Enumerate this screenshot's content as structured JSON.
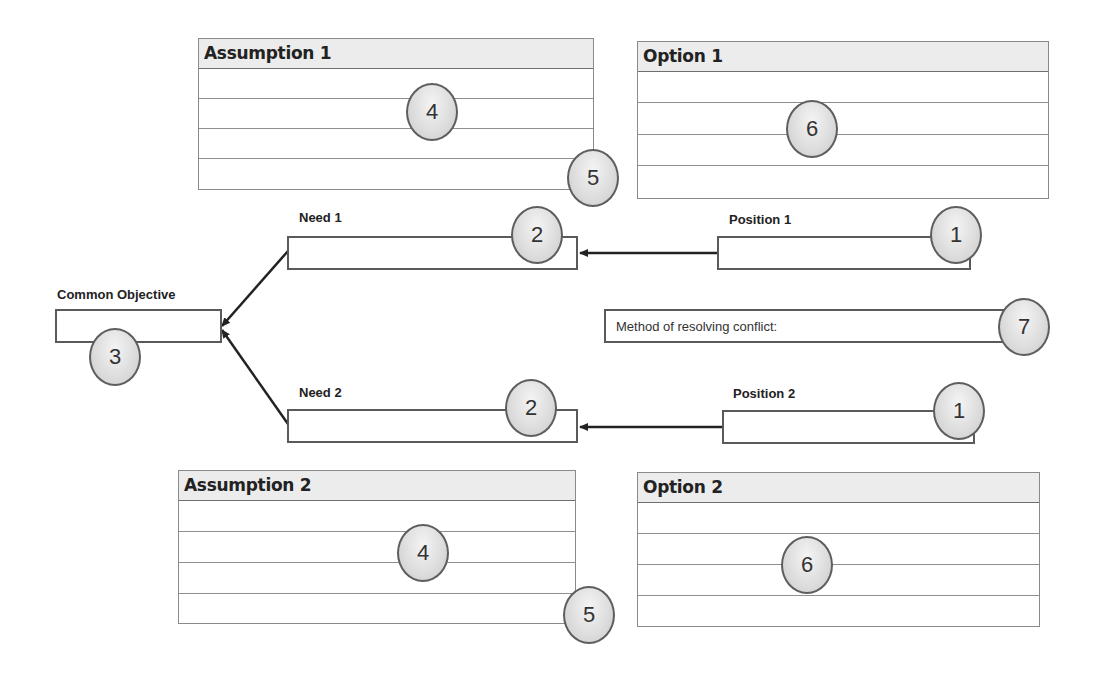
{
  "diagram": {
    "assumption_1": {
      "title": "Assumption 1",
      "rows": 4
    },
    "assumption_2": {
      "title": "Assumption 2",
      "rows": 4
    },
    "option_1": {
      "title": "Option 1",
      "rows": 4
    },
    "option_2": {
      "title": "Option 2",
      "rows": 4
    },
    "need_1": {
      "label": "Need 1",
      "value": ""
    },
    "need_2": {
      "label": "Need 2",
      "value": ""
    },
    "position_1": {
      "label": "Position 1",
      "value": ""
    },
    "position_2": {
      "label": "Position 2",
      "value": ""
    },
    "common_objective": {
      "label": "Common Objective",
      "value": ""
    },
    "method": {
      "label": "Method of resolving conflict:"
    },
    "badges": {
      "position_1": "1",
      "position_2": "1",
      "need_1": "2",
      "need_2": "2",
      "common_objective": "3",
      "assumption_1_main": "4",
      "assumption_2_main": "4",
      "assumption_1_corner": "5",
      "assumption_2_corner": "5",
      "option_1": "6",
      "option_2": "6",
      "method": "7"
    },
    "connections": [
      {
        "from": "position_1",
        "to": "need_1"
      },
      {
        "from": "position_2",
        "to": "need_2"
      },
      {
        "from": "need_1",
        "to": "common_objective"
      },
      {
        "from": "need_2",
        "to": "common_objective"
      }
    ]
  },
  "colors": {
    "header_fill": "#ececec",
    "border": "#5a5a5a",
    "badge_fill": "#dcdcdc",
    "text": "#222222"
  }
}
